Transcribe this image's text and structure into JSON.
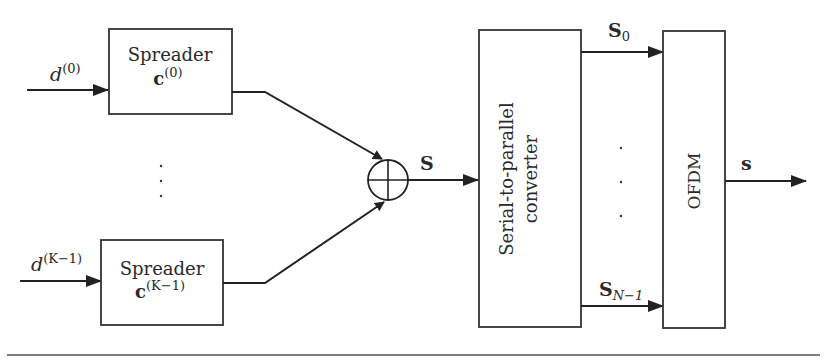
{
  "diagram": {
    "inputs": [
      {
        "label": "d",
        "superscript": "(0)"
      },
      {
        "label": "d",
        "superscript": "(K−1)"
      }
    ],
    "spreaders": [
      {
        "title": "Spreader",
        "code": "c",
        "code_superscript": "(0)"
      },
      {
        "title": "Spreader",
        "code": "c",
        "code_superscript": "(K−1)"
      }
    ],
    "vertical_ellipsis": "·",
    "adder": {
      "symbol": "⊕",
      "output_label": "S"
    },
    "sp_converter": {
      "line1": "Serial-to-parallel",
      "line2": "converter"
    },
    "parallel_outputs": [
      {
        "label": "S",
        "subscript": "0"
      },
      {
        "label": "S",
        "subscript": "N−1"
      }
    ],
    "ofdm": {
      "label": "OFDM"
    },
    "output": {
      "label": "s"
    }
  }
}
